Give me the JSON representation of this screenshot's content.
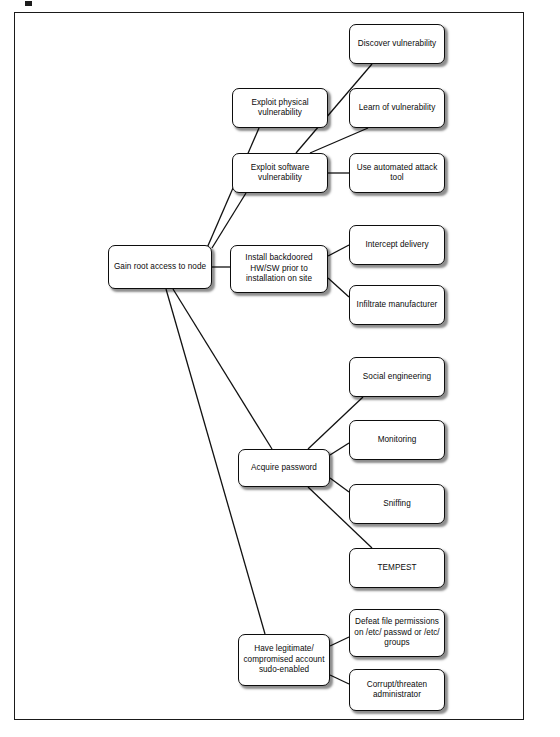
{
  "diagram": {
    "type": "attack-tree",
    "title": "Gain root access to node",
    "frame": {
      "visible": true
    },
    "nodes": [
      {
        "id": "root",
        "label": "Gain root access to node",
        "x": 108,
        "y": 245,
        "w": 104,
        "h": 44
      },
      {
        "id": "exploit-phys",
        "label": "Exploit physical vulnerability",
        "x": 232,
        "y": 88,
        "w": 96,
        "h": 40
      },
      {
        "id": "exploit-sw",
        "label": "Exploit software vulnerability",
        "x": 232,
        "y": 153,
        "w": 96,
        "h": 40
      },
      {
        "id": "install-backdoor",
        "label": "Install backdoored HW/SW prior to installation on site",
        "x": 230,
        "y": 245,
        "w": 98,
        "h": 48
      },
      {
        "id": "acquire-pass",
        "label": "Acquire password",
        "x": 238,
        "y": 449,
        "w": 92,
        "h": 38
      },
      {
        "id": "have-account",
        "label": "Have legitimate/ compromised account sudo-enabled",
        "x": 238,
        "y": 634,
        "w": 92,
        "h": 52
      },
      {
        "id": "discover-vuln",
        "label": "Discover vulnerability",
        "x": 349,
        "y": 24,
        "w": 96,
        "h": 40
      },
      {
        "id": "learn-vuln",
        "label": "Learn of vulnerability",
        "x": 349,
        "y": 88,
        "w": 96,
        "h": 40
      },
      {
        "id": "auto-tool",
        "label": "Use automated attack tool",
        "x": 349,
        "y": 153,
        "w": 96,
        "h": 40
      },
      {
        "id": "intercept",
        "label": "Intercept delivery",
        "x": 349,
        "y": 225,
        "w": 96,
        "h": 40
      },
      {
        "id": "infiltrate",
        "label": "Infiltrate manufacturer",
        "x": 349,
        "y": 285,
        "w": 96,
        "h": 40
      },
      {
        "id": "social-eng",
        "label": "Social engineering",
        "x": 349,
        "y": 357,
        "w": 96,
        "h": 40
      },
      {
        "id": "monitoring",
        "label": "Monitoring",
        "x": 349,
        "y": 420,
        "w": 96,
        "h": 40
      },
      {
        "id": "sniffing",
        "label": "Sniffing",
        "x": 349,
        "y": 484,
        "w": 96,
        "h": 40
      },
      {
        "id": "tempest",
        "label": "TEMPEST",
        "x": 349,
        "y": 548,
        "w": 96,
        "h": 40
      },
      {
        "id": "defeat-perms",
        "label": "Defeat file permissions on /etc/ passwd or /etc/ groups",
        "x": 349,
        "y": 609,
        "w": 96,
        "h": 48
      },
      {
        "id": "corrupt-admin",
        "label": "Corrupt/threaten administrator",
        "x": 349,
        "y": 669,
        "w": 96,
        "h": 42
      }
    ],
    "edges": [
      {
        "from": "root",
        "to": "exploit-phys",
        "x1": 207,
        "y1": 248,
        "x2": 259,
        "y2": 128
      },
      {
        "from": "root",
        "to": "exploit-sw",
        "x1": 212,
        "y1": 248,
        "x2": 246,
        "y2": 193
      },
      {
        "from": "root",
        "to": "install-backdoor",
        "x1": 212,
        "y1": 267,
        "x2": 230,
        "y2": 267
      },
      {
        "from": "root",
        "to": "acquire-pass",
        "x1": 173,
        "y1": 289,
        "x2": 272,
        "y2": 449
      },
      {
        "from": "root",
        "to": "have-account",
        "x1": 166,
        "y1": 289,
        "x2": 265,
        "y2": 634
      },
      {
        "from": "exploit-sw",
        "to": "discover-vuln",
        "x1": 296,
        "y1": 153,
        "x2": 372,
        "y2": 64
      },
      {
        "from": "exploit-sw",
        "to": "learn-vuln",
        "x1": 310,
        "y1": 153,
        "x2": 368,
        "y2": 128
      },
      {
        "from": "exploit-sw",
        "to": "auto-tool",
        "x1": 328,
        "y1": 173,
        "x2": 349,
        "y2": 173
      },
      {
        "from": "install-backdoor",
        "to": "intercept",
        "x1": 328,
        "y1": 256,
        "x2": 349,
        "y2": 245
      },
      {
        "from": "install-backdoor",
        "to": "infiltrate",
        "x1": 328,
        "y1": 278,
        "x2": 349,
        "y2": 297
      },
      {
        "from": "acquire-pass",
        "to": "social-eng",
        "x1": 308,
        "y1": 449,
        "x2": 363,
        "y2": 397
      },
      {
        "from": "acquire-pass",
        "to": "monitoring",
        "x1": 330,
        "y1": 455,
        "x2": 349,
        "y2": 443
      },
      {
        "from": "acquire-pass",
        "to": "sniffing",
        "x1": 330,
        "y1": 478,
        "x2": 349,
        "y2": 492
      },
      {
        "from": "acquire-pass",
        "to": "tempest",
        "x1": 308,
        "y1": 487,
        "x2": 372,
        "y2": 548
      },
      {
        "from": "have-account",
        "to": "defeat-perms",
        "x1": 330,
        "y1": 646,
        "x2": 349,
        "y2": 637
      },
      {
        "from": "have-account",
        "to": "corrupt-admin",
        "x1": 330,
        "y1": 675,
        "x2": 349,
        "y2": 684
      }
    ]
  }
}
